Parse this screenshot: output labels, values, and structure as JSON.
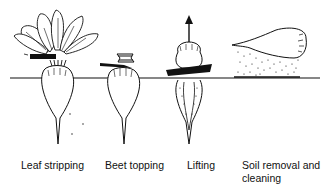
{
  "diagram": {
    "type": "process-sequence",
    "ground_line": true,
    "steps": [
      {
        "id": "leaf-stripping",
        "label": "Leaf stripping"
      },
      {
        "id": "beet-topping",
        "label": "Beet topping"
      },
      {
        "id": "lifting",
        "label": "Lifting",
        "icon": "up-arrow-icon"
      },
      {
        "id": "soil-removal",
        "label": "Soil removal and cleaning"
      }
    ],
    "colors": {
      "ink": "#111111",
      "background": "#ffffff"
    }
  }
}
